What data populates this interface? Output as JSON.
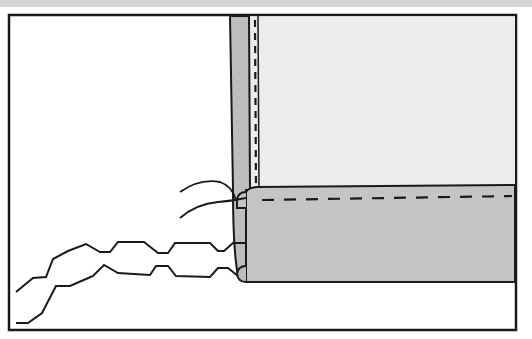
{
  "illustration": {
    "subject": "sewing hem diagram: folded fabric corner with stitched hem and loose thread ends",
    "colors": {
      "background": "#ffffff",
      "top_band": "#d6d6d6",
      "outline": "#1a1a1a",
      "upper_fabric": "#ececec",
      "vertical_strip": "#bdbdbd",
      "hem_band": "#c4c4c4"
    },
    "frame": {
      "x": 9,
      "y": 15,
      "width": 507,
      "height": 315
    },
    "upper_fabric": {
      "x": 250,
      "y": 16,
      "width": 265,
      "height": 172
    },
    "vertical_strip": {
      "x": 230,
      "y": 16,
      "width": 20,
      "height": 266
    },
    "hem_band": {
      "x": 246,
      "y": 187,
      "width": 269,
      "height": 95
    }
  }
}
